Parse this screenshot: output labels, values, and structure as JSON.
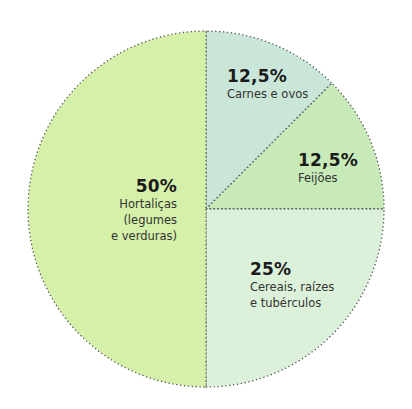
{
  "chart_data": {
    "type": "pie",
    "title": "",
    "slices": [
      {
        "label": "Carnes e ovos",
        "value": 12.5,
        "display": "12,5%",
        "color": "#c9e6d9"
      },
      {
        "label": "Feijões",
        "value": 12.5,
        "display": "12,5%",
        "color": "#c8e9b8"
      },
      {
        "label": "Cereais, raízes e tubérculos",
        "value": 25,
        "display": "25%",
        "color": "#dcf1da"
      },
      {
        "label": "Hortaliças (legumes e verduras)",
        "value": 50,
        "display": "50%",
        "color": "#d5f0a8"
      }
    ],
    "start_angle_deg": 0,
    "direction": "clockwise from 12 o'clock",
    "border_style": "dotted",
    "border_color": "#555555"
  },
  "labels": {
    "carnes": {
      "pct": "12,5%",
      "line1": "Carnes e ovos"
    },
    "feijoes": {
      "pct": "12,5%",
      "line1": "Feijões"
    },
    "cereais": {
      "pct": "25%",
      "line1": "Cereais, raízes",
      "line2": "e tubérculos"
    },
    "hortalicas": {
      "pct": "50%",
      "line1": "Hortaliças",
      "line2": "(legumes",
      "line3": "e verduras)"
    }
  }
}
